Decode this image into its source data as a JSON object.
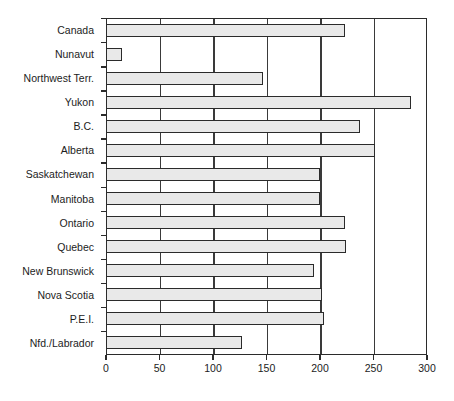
{
  "chart_data": {
    "type": "bar",
    "orientation": "horizontal",
    "title": "",
    "xlabel": "",
    "ylabel": "",
    "xlim": [
      0,
      300
    ],
    "xticks": [
      0,
      50,
      100,
      150,
      200,
      250,
      300
    ],
    "xtick_labels": [
      "0",
      "50",
      "100",
      "150",
      "200",
      "250",
      "300"
    ],
    "grid": true,
    "grid_axis": "x",
    "legend": false,
    "categories": [
      "Canada",
      "Nunavut",
      "Northwest Terr.",
      "Yukon",
      "B.C.",
      "Alberta",
      "Saskatchewan",
      "Manitoba",
      "Ontario",
      "Quebec",
      "New Brunswick",
      "Nova Scotia",
      "P.E.I.",
      "Nfd./Labrador"
    ],
    "values": [
      223,
      15,
      147,
      285,
      237,
      251,
      200,
      200,
      223,
      224,
      194,
      202,
      204,
      127
    ],
    "colors": {
      "bar_fill": "#e9e9e9",
      "bar_stroke": "#2b2b2b",
      "axis": "#2b2b2b",
      "grid": "#3a3a3a",
      "text": "#1c1c1c",
      "background": "#ffffff"
    }
  }
}
